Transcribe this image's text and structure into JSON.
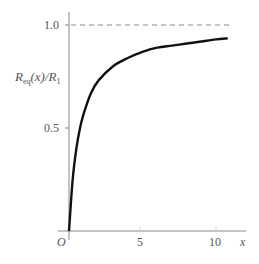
{
  "chart_data": {
    "type": "line",
    "title": "",
    "xlabel": "x",
    "ylabel": "R_eq(x)/R_1",
    "ylabel_parts": {
      "main": "R",
      "sub_eq": "eq",
      "mid": "(x)/",
      "main2": "R",
      "sub_1": "1"
    },
    "origin_label": "O",
    "xlim": [
      0,
      11.5
    ],
    "ylim": [
      0,
      1.1
    ],
    "x_ticks": [
      5,
      10
    ],
    "x_tick_labels": [
      "5",
      "10"
    ],
    "y_ticks": [
      0.5,
      1.0
    ],
    "y_tick_labels": [
      "0.5",
      "1.0"
    ],
    "grid": false,
    "asymptote": {
      "y": 1.0,
      "style": "dashed"
    },
    "series": [
      {
        "name": "R_eq(x)/R_1",
        "x": [
          0,
          0.25,
          0.5,
          0.75,
          1,
          1.5,
          2,
          3,
          4,
          5,
          6,
          7,
          8,
          9,
          10,
          10.8
        ],
        "values": [
          0,
          0.25,
          0.4,
          0.5,
          0.57,
          0.67,
          0.73,
          0.8,
          0.84,
          0.87,
          0.89,
          0.9,
          0.91,
          0.92,
          0.93,
          0.935
        ]
      }
    ]
  }
}
